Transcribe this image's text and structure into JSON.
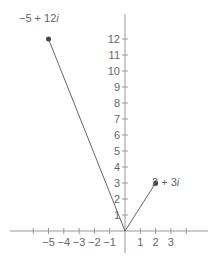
{
  "chart_data": {
    "type": "scatter",
    "title": "",
    "points": [
      {
        "label": "−5 + 12i",
        "re": -5,
        "im": 12
      },
      {
        "label": "2 + 3i",
        "re": 2,
        "im": 3
      }
    ],
    "x_ticks": [
      -6,
      -5,
      -4,
      -3,
      -2,
      -1,
      1,
      2,
      3,
      4
    ],
    "x_tick_labels": [
      "−5",
      "−4",
      "−3",
      "−2",
      "−1",
      "1",
      "2",
      "3"
    ],
    "y_ticks": [
      1,
      2,
      3,
      4,
      5,
      6,
      7,
      8,
      9,
      10,
      11,
      12
    ],
    "y_tick_labels": [
      "1",
      "2",
      "3",
      "4",
      "5",
      "6",
      "7",
      "8",
      "9",
      "10",
      "11",
      "12"
    ],
    "xlim": [
      -7.5,
      6
    ],
    "ylim": [
      -2,
      13
    ],
    "grid": false
  },
  "labels": {
    "point_a_re": "−5 + 12",
    "point_a_im": "i",
    "point_b_re": "2 + 3",
    "point_b_im": "i"
  },
  "colors": {
    "axis": "#999999",
    "vector": "#666666",
    "point": "#444444",
    "text": "#666666"
  }
}
